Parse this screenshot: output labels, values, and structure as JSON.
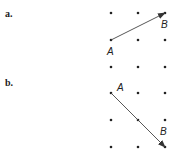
{
  "parts": [
    {
      "label": "a.",
      "grid": {
        "cols_x": [
          111,
          138,
          165
        ],
        "rows_y": [
          13,
          40,
          67
        ]
      },
      "vector": {
        "from": "A",
        "to": "B",
        "from_pt": [
          111,
          40
        ],
        "to_pt": [
          165,
          13
        ]
      },
      "points": {
        "A": {
          "text": "A",
          "x": 107,
          "y": 55
        },
        "B": {
          "text": "B",
          "x": 161,
          "y": 28
        }
      }
    },
    {
      "label": "b.",
      "grid": {
        "cols_x": [
          111,
          138,
          165
        ],
        "rows_y": [
          93,
          120,
          147
        ]
      },
      "vector": {
        "from": "A",
        "to": "B",
        "from_pt": [
          111,
          93
        ],
        "to_pt": [
          165,
          147
        ]
      },
      "points": {
        "A": {
          "text": "A",
          "x": 117,
          "y": 91
        },
        "B": {
          "text": "B",
          "x": 160,
          "y": 135
        }
      }
    }
  ],
  "colors": {
    "dot": "#222222",
    "arrow": "#444444",
    "text": "#222222"
  }
}
